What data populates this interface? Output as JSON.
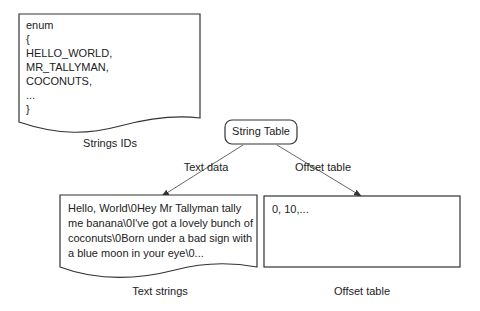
{
  "enum_doc": {
    "lines": [
      "enum",
      "{",
      "HELLO_WORLD,",
      "MR_TALLYMAN,",
      "COCONUTS,",
      "...",
      "}"
    ],
    "caption": "Strings IDs"
  },
  "string_table": {
    "label": "String Table"
  },
  "edges": {
    "left_label": "Text data",
    "right_label": "Offset table"
  },
  "text_doc": {
    "lines": [
      "Hello, World\\0Hey Mr Tallyman tally",
      "me banana\\0I've got a lovely bunch of",
      "coconuts\\0Born under a bad sign with",
      "a blue moon in your eye\\0..."
    ],
    "caption": "Text strings"
  },
  "offset_box": {
    "content": "0, 10,...",
    "caption": "Offset table"
  },
  "colors": {
    "stroke": "#333333",
    "text": "#222222",
    "background": "#ffffff"
  }
}
